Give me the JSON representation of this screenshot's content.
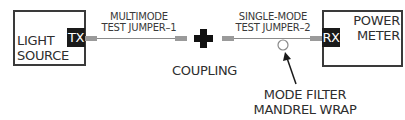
{
  "diagram": {
    "title": "",
    "light_source": {
      "label_line1": "LIGHT",
      "label_line2": "SOURCE",
      "port": "TX"
    },
    "jumper_1": {
      "label_line1": "MULTIMODE",
      "label_line2": "TEST JUMPER–1"
    },
    "coupling": {
      "label": "COUPLING",
      "symbol": "plus-icon"
    },
    "jumper_2": {
      "label_line1": "SINGLE-MODE",
      "label_line2": "TEST JUMPER–2"
    },
    "power_meter": {
      "label_line1": "POWER",
      "label_line2": "METER",
      "port": "RX"
    },
    "mandrel": {
      "label_line1": "MODE FILTER",
      "label_line2": "MANDREL WRAP",
      "icon": "mandrel-circle-icon"
    },
    "colors": {
      "box_border": "#3a3a3a",
      "port_fill": "#1a1a1a",
      "connector": "#9a9a9a",
      "fiber": "#8a8a8a",
      "coupling": "#111111"
    }
  }
}
